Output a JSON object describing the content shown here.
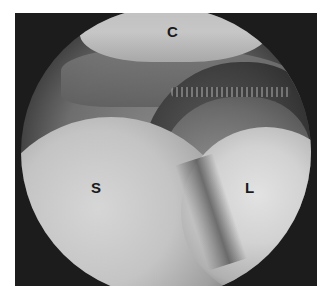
{
  "image": {
    "description": "Grayscale arthroscopic view with labeled anatomical regions",
    "labels": {
      "top": "C",
      "left": "S",
      "right": "L"
    }
  }
}
